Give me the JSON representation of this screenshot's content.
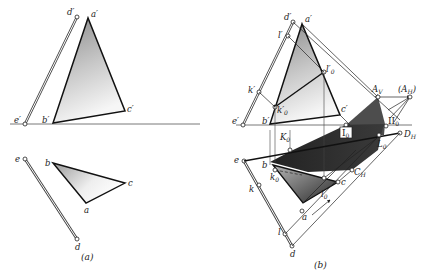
{
  "figure": {
    "panel_a": {
      "caption": "(a)",
      "front_view": {
        "labels": {
          "d": "d′",
          "a": "a′",
          "e": "e′",
          "b": "b′",
          "c": "c′"
        }
      },
      "top_view": {
        "labels": {
          "e": "e",
          "b": "b",
          "c": "c",
          "a": "a",
          "d": "d"
        }
      }
    },
    "panel_b": {
      "caption": "(b)",
      "front_view": {
        "labels": {
          "d": "d′",
          "a": "a′",
          "l": "l′",
          "l0": "l′",
          "l0_sub": "0",
          "k": "k′",
          "k0": "k′",
          "k0_sub": "0",
          "e": "e′",
          "b": "b′",
          "c": "c′"
        }
      },
      "shadow": {
        "labels": {
          "Av": "A",
          "Av_sub": "V",
          "AH": "(A",
          "AH_sub": "H",
          "AH_close": ")",
          "II0": "II",
          "II0_sub": "0",
          "I0": "I",
          "I0_sub": "0",
          "DH": "D",
          "DH_sub": "H",
          "L0": "L",
          "L0_sub": "0",
          "K0": "K",
          "K0_sub": "0",
          "CH": "C",
          "CH_sub": "H"
        }
      },
      "top_view": {
        "labels": {
          "e": "e",
          "b": "b",
          "k0": "k",
          "k0_sub": "0",
          "k": "k",
          "c": "c",
          "l0": "l",
          "l0_sub": "0",
          "a": "a",
          "l": "l",
          "d": "d"
        }
      }
    },
    "colors": {
      "line": "#1a1a1a",
      "shadow_dark": "#2e2e2e",
      "shadow_mid": "#555555",
      "fill_light": "#cfcfcf"
    }
  }
}
